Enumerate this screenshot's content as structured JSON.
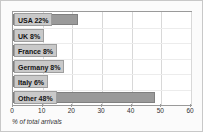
{
  "chart_data": {
    "type": "bar",
    "orientation": "horizontal",
    "title": "",
    "xlabel": "% of total arrivals",
    "ylabel": "",
    "xlim": [
      0,
      60
    ],
    "xticks": [
      0,
      10,
      20,
      30,
      40,
      50,
      60
    ],
    "grid": true,
    "legend": false,
    "categories": [
      "USA",
      "UK",
      "France",
      "Germany",
      "Italy",
      "Other"
    ],
    "values": [
      22,
      8,
      8,
      8,
      6,
      48
    ],
    "bar_labels": [
      "USA 22%",
      "UK 8%",
      "France 8%",
      "Germany 8%",
      "Italy 6%",
      "Other 48%"
    ]
  },
  "colors": {
    "bar_fill": "#9a9a9a",
    "bar_stroke": "#808080",
    "label_chip": "#c9c9c9",
    "plot_border": "#9a9a9a",
    "frame_border": "#c8c8c8",
    "frame_background": "#fbfbfb",
    "gridline": "#d8d8d8"
  }
}
